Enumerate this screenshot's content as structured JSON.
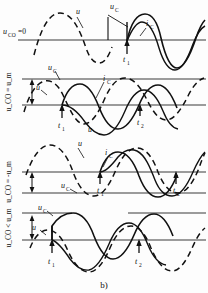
{
  "figure": {
    "caption": "b)",
    "background": "#fdfdfd",
    "stroke": "#111111",
    "axis_color": "#6e6e6e"
  },
  "panels": [
    {
      "id": "panel-1",
      "condition_label": "u",
      "condition_sub": "CO",
      "condition_rest": "=0",
      "condition_full": "u_CO = 0",
      "axis_y": 40,
      "labels": [
        {
          "name": "u-curve-label",
          "main": "u",
          "sub": "",
          "x": 76,
          "y": 14
        },
        {
          "name": "uc-label",
          "main": "u",
          "sub": "C",
          "x": 112,
          "y": 9
        },
        {
          "name": "ic-label",
          "main": "i",
          "sub": "C",
          "x": 145,
          "y": 26
        },
        {
          "name": "t1-label",
          "main": "t",
          "sub": "1",
          "x": 123,
          "y": 58
        }
      ],
      "markers": [
        "t1"
      ]
    },
    {
      "id": "panel-2",
      "condition_label": "u",
      "condition_sub": "CO",
      "condition_rest": "= u_m",
      "condition_full": "u_CO = u_m",
      "axis_y": 105,
      "upper_y": 79,
      "labels": [
        {
          "name": "uc-label",
          "main": "u",
          "sub": "C",
          "x": 50,
          "y": 69
        },
        {
          "name": "u-curve-label",
          "main": "u",
          "sub": "",
          "x": 36,
          "y": 88
        },
        {
          "name": "ic-label",
          "main": "i",
          "sub": "C",
          "x": 101,
          "y": 80
        },
        {
          "name": "t1-label",
          "main": "t",
          "sub": "1",
          "x": 61,
          "y": 125
        },
        {
          "name": "t2-label",
          "main": "t",
          "sub": "2",
          "x": 139,
          "y": 121
        },
        {
          "name": "u-bottom-label",
          "main": "u",
          "sub": "",
          "x": 88,
          "y": 130
        }
      ],
      "markers": [
        "t1",
        "t2"
      ]
    },
    {
      "id": "panel-3",
      "condition_label": "u",
      "condition_sub": "CO",
      "condition_rest": "= -u_m",
      "condition_full": "u_CO = -u_m",
      "axis_y": 172,
      "lower_y": 193,
      "labels": [
        {
          "name": "u-curve-label",
          "main": "u",
          "sub": "",
          "x": 78,
          "y": 145
        },
        {
          "name": "ic-label",
          "main": "i",
          "sub": "C",
          "x": 104,
          "y": 154
        },
        {
          "name": "uc-label",
          "main": "u",
          "sub": "C",
          "x": 62,
          "y": 186
        },
        {
          "name": "t1-label",
          "main": "t",
          "sub": "1",
          "x": 100,
          "y": 190
        },
        {
          "name": "t2-label",
          "main": "t",
          "sub": "2",
          "x": 175,
          "y": 190
        }
      ],
      "markers": [
        "t1",
        "t2"
      ]
    },
    {
      "id": "panel-4",
      "condition_label": "u",
      "condition_sub": "CO",
      "condition_rest": "< u_m",
      "condition_full": "u_CO < u_m",
      "axis_y": 240,
      "upper_y": 213,
      "labels": [
        {
          "name": "uc-label",
          "main": "u",
          "sub": "C",
          "x": 40,
          "y": 209
        },
        {
          "name": "u-curve-label",
          "main": "u",
          "sub": "",
          "x": 33,
          "y": 228
        },
        {
          "name": "t1-label",
          "main": "t",
          "sub": "1",
          "x": 51,
          "y": 262
        },
        {
          "name": "t2-label",
          "main": "t",
          "sub": "2",
          "x": 138,
          "y": 262
        }
      ],
      "markers": [
        "t1",
        "t2"
      ]
    }
  ],
  "series_names": {
    "voltage_source": "u",
    "capacitor_voltage": "u_C",
    "capacitor_current": "i_C"
  }
}
